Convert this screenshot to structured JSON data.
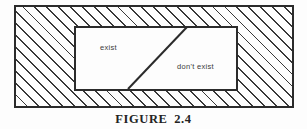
{
  "figure": {
    "caption": "FIGURE 2.4",
    "regions": {
      "exist_label": "exist",
      "dont_exist_label": "don't exist"
    },
    "colors": {
      "ink": "#2b2b2b",
      "hatch_line": "#383838",
      "paper": "#fdfdfd"
    }
  }
}
